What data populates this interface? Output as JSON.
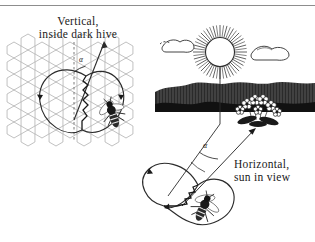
{
  "figure": {
    "title_hive": "Vertical,",
    "title_hive_line2": "inside dark hive",
    "title_field": "Horizontal,",
    "title_field_line2": "sun in view",
    "angle_symbol_hive": "α",
    "angle_symbol_field": "α"
  },
  "colors": {
    "ink": "#1a1a1a",
    "line": "#2b2b2b",
    "comb": "#9a9a9a",
    "rule": "#8d8d8d",
    "paper": "#ffffff",
    "treeline": "#1e1e1e"
  },
  "panels": {
    "hive": {
      "label": "honeycomb-panel",
      "description_elements": [
        "honeycomb-cells",
        "vertical-dashed-gravity-line",
        "figure-eight-dance-path",
        "waggle-run-zigzag",
        "direction-arrow",
        "angle-arc",
        "dancing-bee"
      ]
    },
    "field": {
      "label": "landscape-panel",
      "description_elements": [
        "sun",
        "sun-rays",
        "cloud-left",
        "cloud-right",
        "treeline-horizon",
        "flower-cluster",
        "sun-bearing-line",
        "flower-bearing-line",
        "angle-arc",
        "figure-eight-dance-path",
        "waggle-run-zigzag",
        "foraging-bee"
      ]
    }
  },
  "icons": {
    "sun": "sun-icon",
    "cloud": "cloud-icon",
    "flower": "flower-icon",
    "bee": "bee-icon",
    "arrow": "arrow-icon"
  }
}
